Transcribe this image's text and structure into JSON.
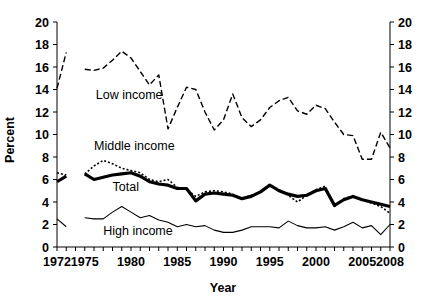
{
  "chart_data": {
    "type": "line",
    "title": "",
    "xlabel": "Year",
    "ylabel": "Percent",
    "xlim": [
      1972,
      2008
    ],
    "ylim": [
      0,
      20
    ],
    "ytick_step": 2,
    "xtick_labels": [
      "1972",
      "1975",
      "1980",
      "1985",
      "1990",
      "1995",
      "2000",
      "2005",
      "2008"
    ],
    "xtick_values": [
      1972,
      1975,
      1980,
      1985,
      1990,
      1995,
      2000,
      2005,
      2008
    ],
    "ytick_labels": [
      "0",
      "2",
      "4",
      "6",
      "8",
      "10",
      "12",
      "14",
      "16",
      "18",
      "20"
    ],
    "ytick_values": [
      0,
      2,
      4,
      6,
      8,
      10,
      12,
      14,
      16,
      18,
      20
    ],
    "grid": false,
    "legend_position": "inline-annotations",
    "dual_y_axis": true,
    "right_axis_mirrors_left": true,
    "annotations": [
      {
        "text": "Low income",
        "x": 1976.2,
        "y": 13.2
      },
      {
        "text": "Middle income",
        "x": 1976.0,
        "y": 8.6
      },
      {
        "text": "Total",
        "x": 1978.0,
        "y": 5.0
      },
      {
        "text": "High income",
        "x": 1977.0,
        "y": 1.1
      }
    ],
    "series": [
      {
        "name": "Low income",
        "style": "dashed",
        "stroke_width": 1.4,
        "dash_pattern": "6,3",
        "x": [
          1972,
          1973,
          1975,
          1976,
          1977,
          1978,
          1979,
          1980,
          1981,
          1982,
          1983,
          1984,
          1985,
          1986,
          1987,
          1988,
          1989,
          1990,
          1991,
          1992,
          1993,
          1994,
          1995,
          1996,
          1997,
          1998,
          1999,
          2000,
          2001,
          2002,
          2003,
          2004,
          2005,
          2006,
          2007,
          2008
        ],
        "values": [
          14.1,
          17.3,
          15.8,
          15.7,
          15.9,
          16.6,
          17.4,
          16.8,
          15.6,
          14.4,
          15.3,
          10.5,
          12.4,
          14.2,
          14.0,
          12.0,
          10.4,
          11.3,
          13.6,
          11.5,
          10.7,
          11.3,
          12.4,
          13.0,
          13.3,
          12.1,
          11.8,
          12.6,
          12.3,
          11.1,
          10.0,
          9.9,
          7.8,
          7.8,
          10.2,
          8.8
        ]
      },
      {
        "name": "Middle income",
        "style": "dotted",
        "stroke_width": 1.6,
        "dash_pattern": "2,2",
        "x": [
          1972,
          1973,
          1975,
          1976,
          1977,
          1978,
          1979,
          1980,
          1981,
          1982,
          1983,
          1984,
          1985,
          1986,
          1987,
          1988,
          1989,
          1990,
          1991,
          1992,
          1993,
          1994,
          1995,
          1996,
          1997,
          1998,
          1999,
          2000,
          2001,
          2002,
          2003,
          2004,
          2005,
          2006,
          2007,
          2008
        ],
        "values": [
          6.6,
          6.4,
          6.5,
          7.2,
          7.7,
          7.4,
          7.0,
          6.8,
          6.6,
          6.0,
          5.8,
          6.0,
          5.3,
          5.1,
          4.5,
          4.9,
          5.0,
          4.9,
          4.7,
          4.3,
          4.6,
          4.9,
          5.5,
          5.1,
          4.6,
          4.0,
          4.6,
          5.1,
          5.4,
          3.6,
          4.3,
          4.5,
          4.2,
          3.9,
          3.6,
          3.0
        ]
      },
      {
        "name": "Total",
        "style": "solid-bold",
        "stroke_width": 3.2,
        "dash_pattern": "",
        "x": [
          1972,
          1973,
          1975,
          1976,
          1977,
          1978,
          1979,
          1980,
          1981,
          1982,
          1983,
          1984,
          1985,
          1986,
          1987,
          1988,
          1989,
          1990,
          1991,
          1992,
          1993,
          1994,
          1995,
          1996,
          1997,
          1998,
          1999,
          2000,
          2001,
          2002,
          2003,
          2004,
          2005,
          2006,
          2007,
          2008
        ],
        "values": [
          5.8,
          6.3,
          6.5,
          6.0,
          6.2,
          6.4,
          6.5,
          6.6,
          6.3,
          5.8,
          5.6,
          5.5,
          5.2,
          5.2,
          4.1,
          4.7,
          4.8,
          4.7,
          4.6,
          4.3,
          4.5,
          4.9,
          5.5,
          5.0,
          4.7,
          4.5,
          4.6,
          5.0,
          5.2,
          3.7,
          4.2,
          4.5,
          4.2,
          4.0,
          3.8,
          3.6
        ]
      },
      {
        "name": "High income",
        "style": "solid-thin",
        "stroke_width": 1.1,
        "dash_pattern": "",
        "x": [
          1972,
          1973,
          1975,
          1976,
          1977,
          1978,
          1979,
          1980,
          1981,
          1982,
          1983,
          1984,
          1985,
          1986,
          1987,
          1988,
          1989,
          1990,
          1991,
          1992,
          1993,
          1994,
          1995,
          1996,
          1997,
          1998,
          1999,
          2000,
          2001,
          2002,
          2003,
          2004,
          2005,
          2006,
          2007,
          2008
        ],
        "values": [
          2.5,
          1.8,
          2.6,
          2.5,
          2.5,
          3.1,
          3.6,
          3.1,
          2.6,
          2.8,
          2.4,
          2.2,
          1.8,
          2.0,
          1.8,
          1.9,
          1.5,
          1.3,
          1.3,
          1.5,
          1.8,
          1.8,
          1.8,
          1.7,
          2.3,
          1.9,
          1.7,
          1.7,
          1.8,
          1.5,
          1.8,
          2.2,
          1.7,
          1.9,
          1.1,
          2.0
        ]
      }
    ],
    "notes": {
      "series_break": "A gap in the plotted lines occurs between 1973 and 1975 (no 1974 data)."
    }
  }
}
